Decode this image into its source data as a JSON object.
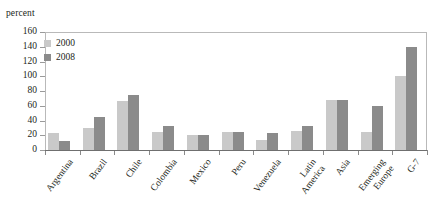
{
  "chart_data": {
    "type": "bar",
    "title": "",
    "xlabel": "",
    "ylabel": "percent",
    "ylim": [
      0,
      160
    ],
    "yticks": [
      0,
      20,
      40,
      60,
      80,
      100,
      120,
      140,
      160
    ],
    "grid": false,
    "legend_position": "top-left",
    "categories": [
      "Argentina",
      "Brazil",
      "Chile",
      "Colombia",
      "Mexico",
      "Peru",
      "Venezuela",
      "Latin America",
      "Asia",
      "Emerging Europe",
      "G-7"
    ],
    "series": [
      {
        "name": "2000",
        "color": "#c9c9c9",
        "values": [
          23,
          30,
          66,
          24,
          20,
          25,
          13,
          26,
          68,
          24,
          100
        ]
      },
      {
        "name": "2008",
        "color": "#8b8b8b",
        "values": [
          12,
          45,
          74,
          32,
          20,
          25,
          23,
          32,
          68,
          60,
          140
        ]
      }
    ]
  },
  "axis": {
    "unit_caption": "percent"
  },
  "labels": {
    "category_display": [
      "Argentina",
      "Brazil",
      "Chile",
      "Colombia",
      "Mexico",
      "Peru",
      "Venezuela",
      "Latin\nAmerica",
      "Asia",
      "Emerging\nEurope",
      "G-7"
    ]
  }
}
